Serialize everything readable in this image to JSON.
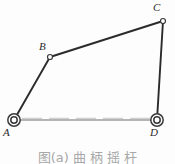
{
  "figure": {
    "kind": "four-bar-linkage-mechanism",
    "caption": "图(a)  曲 柄 摇 杆",
    "background_color": "#fdfdfd",
    "line_color": "#2b2b2b",
    "ground_color": "#9b9b9b",
    "label_color": "#2b2b2b"
  },
  "joints": [
    {
      "id": "A",
      "label": "A",
      "type": "fixed-pivot",
      "x": 14,
      "y": 120,
      "radius_outer": 6.2,
      "radius_inner": 3.3
    },
    {
      "id": "B",
      "label": "B",
      "type": "pin-joint",
      "x": 50,
      "y": 57,
      "radius_outer": 2.6,
      "radius_inner": 0
    },
    {
      "id": "C",
      "label": "C",
      "type": "pin-joint",
      "x": 163,
      "y": 21,
      "radius_outer": 2.6,
      "radius_inner": 0
    },
    {
      "id": "D",
      "label": "D",
      "type": "fixed-pivot",
      "x": 157,
      "y": 120,
      "radius_outer": 6.2,
      "radius_inner": 3.3
    }
  ],
  "links": [
    {
      "id": "AB",
      "from": "A",
      "to": "B",
      "style": "solid",
      "width": 1.9,
      "role": "crank"
    },
    {
      "id": "BC",
      "from": "B",
      "to": "C",
      "style": "solid",
      "width": 1.9,
      "role": "coupler"
    },
    {
      "id": "CD",
      "from": "C",
      "to": "D",
      "style": "solid",
      "width": 1.9,
      "role": "rocker"
    },
    {
      "id": "AD",
      "from": "A",
      "to": "D",
      "style": "ground",
      "width": 1.5,
      "role": "frame"
    }
  ],
  "labels": {
    "A": "A",
    "B": "B",
    "C": "C",
    "D": "D"
  }
}
